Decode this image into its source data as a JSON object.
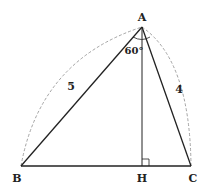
{
  "diagram": {
    "type": "triangle-geometry",
    "points": {
      "A": {
        "label": "A",
        "x": 142,
        "y": 27
      },
      "B": {
        "label": "B",
        "x": 21,
        "y": 166
      },
      "C": {
        "label": "C",
        "x": 191,
        "y": 166
      },
      "H": {
        "label": "H",
        "x": 142,
        "y": 166
      }
    },
    "side_labels": {
      "AB": "5",
      "AC": "4"
    },
    "angle_label": "60°",
    "colors": {
      "line": "#222222",
      "dashed_arc": "#999999"
    }
  }
}
